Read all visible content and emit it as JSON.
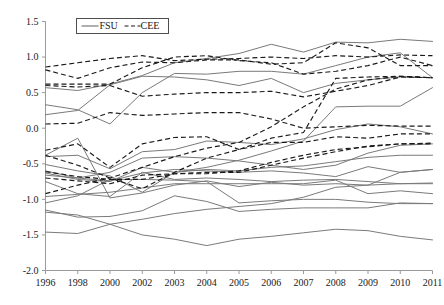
{
  "chart_data": {
    "type": "line",
    "title": "",
    "subtitle": "",
    "xlabel": "",
    "ylabel": "",
    "ylim": [
      -2.0,
      1.5
    ],
    "ytick_labels": [
      "1.5",
      "1.0",
      "0.5",
      "0.0",
      "-0.5",
      "-1.0",
      "-1.5",
      "-2.0"
    ],
    "ytick_values": [
      1.5,
      1.0,
      0.5,
      0.0,
      -0.5,
      -1.0,
      -1.5,
      -2.0
    ],
    "grid": false,
    "legend_position": "top-left",
    "legend": [
      {
        "label": "FSU",
        "style": "solid",
        "color": "#7a7a7a"
      },
      {
        "label": "CEE",
        "style": "dashed",
        "color": "#1a1a1a"
      }
    ],
    "categories": [
      "1996",
      "1998",
      "2000",
      "2002",
      "2003",
      "2004",
      "2005",
      "2006",
      "2007",
      "2008",
      "2009",
      "2010",
      "2011"
    ],
    "x": [
      1996,
      1998,
      2000,
      2002,
      2003,
      2004,
      2005,
      2006,
      2007,
      2008,
      2009,
      2010,
      2011
    ],
    "series": [
      {
        "name": "FSU-1",
        "group": "FSU",
        "style": "solid",
        "values": [
          0.57,
          0.53,
          0.62,
          0.74,
          0.92,
          0.98,
          1.05,
          1.18,
          1.07,
          1.21,
          1.2,
          1.25,
          1.22
        ]
      },
      {
        "name": "FSU-2",
        "group": "FSU",
        "style": "solid",
        "values": [
          0.33,
          0.26,
          0.06,
          0.5,
          0.77,
          0.76,
          0.8,
          0.8,
          0.76,
          0.88,
          1.0,
          1.06,
          0.71
        ]
      },
      {
        "name": "FSU-3",
        "group": "FSU",
        "style": "solid",
        "values": [
          0.19,
          0.25,
          0.61,
          0.73,
          0.72,
          0.68,
          0.6,
          0.7,
          0.5,
          0.63,
          0.68,
          0.72,
          0.71
        ]
      },
      {
        "name": "FSU-4",
        "group": "FSU",
        "style": "solid",
        "values": [
          -0.4,
          -0.38,
          -0.57,
          -0.33,
          -0.3,
          -0.18,
          -0.2,
          -0.23,
          -0.15,
          -0.02,
          0.06,
          0.02,
          -0.08
        ]
      },
      {
        "name": "FSU-5",
        "group": "FSU",
        "style": "solid",
        "values": [
          -0.51,
          -0.6,
          -0.67,
          -0.9,
          -0.62,
          -0.55,
          -0.45,
          -0.32,
          -0.18,
          0.3,
          0.31,
          0.31,
          0.57
        ]
      },
      {
        "name": "FSU-6",
        "group": "FSU",
        "style": "solid",
        "values": [
          -0.63,
          -0.72,
          -0.75,
          -0.55,
          -0.62,
          -0.58,
          -0.6,
          -0.55,
          -0.53,
          -0.47,
          -0.41,
          -0.38,
          -0.38
        ]
      },
      {
        "name": "FSU-7",
        "group": "FSU",
        "style": "solid",
        "values": [
          -0.66,
          -0.7,
          -0.74,
          -0.63,
          -0.58,
          -0.6,
          -0.62,
          -0.6,
          -0.63,
          -0.68,
          -0.54,
          -0.62,
          -0.58
        ]
      },
      {
        "name": "FSU-8",
        "group": "FSU",
        "style": "solid",
        "values": [
          -0.75,
          -0.92,
          -0.96,
          -0.62,
          -0.72,
          -0.7,
          -0.72,
          -0.75,
          -0.73,
          -0.72,
          -0.75,
          -0.78,
          -0.78
        ]
      },
      {
        "name": "FSU-9",
        "group": "FSU",
        "style": "solid",
        "values": [
          -0.96,
          -0.93,
          -0.9,
          -0.84,
          -0.78,
          -0.78,
          -0.78,
          -0.78,
          -0.78,
          -0.73,
          -0.92,
          -0.88,
          -0.92
        ]
      },
      {
        "name": "FSU-10",
        "group": "FSU",
        "style": "solid",
        "values": [
          -1.05,
          -0.95,
          -0.72,
          -0.72,
          -0.73,
          -0.75,
          -1.05,
          -1.02,
          -1.0,
          -1.0,
          -1.04,
          -1.06,
          -1.06
        ]
      },
      {
        "name": "FSU-11",
        "group": "FSU",
        "style": "solid",
        "values": [
          -1.15,
          -1.25,
          -1.24,
          -1.16,
          -0.95,
          -1.03,
          -1.17,
          -1.14,
          -1.12,
          -1.12,
          -1.12,
          -1.05,
          -1.06
        ]
      },
      {
        "name": "FSU-12",
        "group": "FSU",
        "style": "solid",
        "values": [
          -1.18,
          -1.22,
          -1.35,
          -1.5,
          -1.56,
          -1.65,
          -1.56,
          -1.52,
          -1.47,
          -1.42,
          -1.44,
          -1.52,
          -1.57
        ]
      },
      {
        "name": "FSU-13",
        "group": "FSU",
        "style": "solid",
        "values": [
          -1.46,
          -1.48,
          -1.35,
          -1.28,
          -1.2,
          -1.14,
          -1.1,
          -1.06,
          -0.97,
          -0.83,
          -0.8,
          -0.78,
          -0.77
        ]
      },
      {
        "name": "FSU-14",
        "group": "FSU",
        "style": "solid",
        "values": [
          -0.38,
          -0.14,
          -0.98,
          -0.91,
          -0.8,
          -0.74,
          -0.82,
          -0.76,
          -0.8,
          -0.78,
          -0.8,
          -0.62,
          -0.58
        ]
      },
      {
        "name": "FSU-15",
        "group": "FSU",
        "style": "solid",
        "values": [
          -0.6,
          -0.7,
          -0.62,
          -0.42,
          -0.4,
          -0.42,
          -0.46,
          -0.52,
          -0.58,
          -0.52,
          -0.35,
          -0.24,
          -0.22
        ]
      },
      {
        "name": "CEE-1",
        "group": "CEE",
        "style": "dashed",
        "values": [
          0.86,
          0.92,
          0.98,
          1.02,
          0.95,
          0.97,
          0.98,
          1.0,
          0.98,
          1.02,
          1.0,
          1.03,
          1.02
        ]
      },
      {
        "name": "CEE-2",
        "group": "CEE",
        "style": "dashed",
        "values": [
          0.82,
          0.7,
          0.85,
          0.93,
          0.92,
          0.96,
          0.96,
          0.9,
          0.92,
          1.2,
          1.13,
          0.88,
          0.88
        ]
      },
      {
        "name": "CEE-3",
        "group": "CEE",
        "style": "dashed",
        "values": [
          0.62,
          0.62,
          0.62,
          0.85,
          1.0,
          1.02,
          0.95,
          0.92,
          0.76,
          0.8,
          0.88,
          1.0,
          0.88
        ]
      },
      {
        "name": "CEE-4",
        "group": "CEE",
        "style": "dashed",
        "values": [
          0.6,
          0.58,
          0.6,
          0.45,
          0.48,
          0.5,
          0.5,
          0.52,
          0.44,
          0.52,
          0.6,
          0.72,
          0.71
        ]
      },
      {
        "name": "CEE-5",
        "group": "CEE",
        "style": "dashed",
        "values": [
          0.06,
          0.07,
          0.22,
          0.18,
          0.2,
          0.22,
          0.22,
          0.13,
          0.0,
          0.02,
          0.04,
          0.03,
          0.03
        ]
      },
      {
        "name": "CEE-6",
        "group": "CEE",
        "style": "dashed",
        "values": [
          -0.31,
          -0.22,
          -0.55,
          -0.22,
          -0.13,
          -0.12,
          -0.3,
          -0.2,
          -0.2,
          -0.12,
          -0.14,
          -0.08,
          -0.08
        ]
      },
      {
        "name": "CEE-7",
        "group": "CEE",
        "style": "dashed",
        "values": [
          -0.38,
          -0.52,
          -0.7,
          -0.85,
          -0.62,
          -0.42,
          -0.3,
          -0.14,
          -0.06,
          0.7,
          0.72,
          0.73,
          0.71
        ]
      },
      {
        "name": "CEE-8",
        "group": "CEE",
        "style": "dashed",
        "values": [
          -0.61,
          -0.68,
          -0.72,
          -0.72,
          -0.64,
          -0.62,
          -0.62,
          -0.52,
          -0.42,
          -0.33,
          -0.25,
          -0.22,
          -0.21
        ]
      },
      {
        "name": "CEE-9",
        "group": "CEE",
        "style": "dashed",
        "values": [
          -0.7,
          -0.74,
          -0.78,
          -0.66,
          -0.64,
          -0.64,
          -0.6,
          -0.48,
          -0.38,
          -0.3,
          -0.26,
          -0.22,
          -0.22
        ]
      },
      {
        "name": "CEE-10",
        "group": "CEE",
        "style": "dashed",
        "values": [
          -0.92,
          -0.8,
          -0.7,
          -0.55,
          -0.4,
          -0.28,
          -0.2,
          0.02,
          0.3,
          0.55,
          0.68,
          0.73,
          0.71
        ]
      }
    ]
  }
}
